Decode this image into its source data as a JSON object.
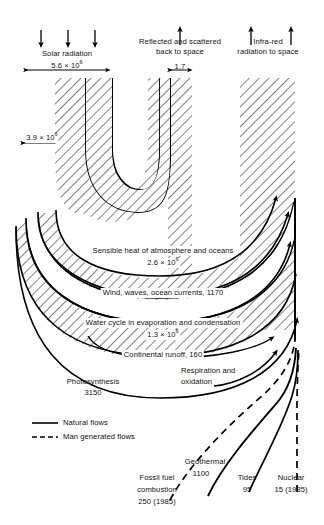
{
  "diagram": {
    "type": "energy-flow-sankey",
    "units_note": "values in 10^12 W (TW) unless noted"
  },
  "inputs": {
    "solar": {
      "label": "Solar radiation",
      "value_base": "5.6 × 10",
      "value_exp": "6",
      "value_text": "5.6 × 10⁶",
      "arrows": 3,
      "direction": "down"
    },
    "reflected": {
      "label_line1": "Reflected and scattered",
      "label_line2": "back to space",
      "value_text": "1.7",
      "arrows": 1,
      "direction": "up"
    },
    "infrared": {
      "label_line1": "Infra-red",
      "label_line2": "radiation to space",
      "arrows": 2,
      "direction": "up"
    }
  },
  "flows": {
    "direct_reflection": {
      "label_base": "3.9 × 10",
      "label_exp": "6",
      "label_text": "3.9 × 10⁶"
    },
    "sensible_heat": {
      "label": "Sensible heat of atmosphere and oceans",
      "value_base": "2.6 × 10",
      "value_exp": "6",
      "value_text": "2.6 × 10⁶"
    },
    "wind": {
      "label": "Wind, waves, ocean currents, 1170",
      "value_text": "1170"
    },
    "water_cycle": {
      "label": "Water cycle in evaporation and condensation",
      "value_base": "1.3 × 10",
      "value_exp": "6",
      "value_text": "1.3 × 10⁶"
    },
    "continental_runoff": {
      "label": "Continental runoff, 160",
      "value_text": "160"
    },
    "photosynthesis": {
      "label": "Photosynthesis",
      "value_text": "3150"
    },
    "respiration": {
      "label_line1": "Respiration and",
      "label_line2": "oxidation"
    }
  },
  "sources": {
    "fossil_fuel": {
      "label_line1": "Fossil fuel",
      "label_line2": "combustion",
      "label_line3": "250 (1985)",
      "style": "dashed"
    },
    "geothermal": {
      "label_line1": "Geothermal",
      "label_line2": "1100",
      "style": "solid"
    },
    "tides": {
      "label_line1": "Tides",
      "label_line2": "95",
      "style": "solid"
    },
    "nuclear": {
      "label_line1": "Nuclear",
      "label_line2": "15 (1985)",
      "style": "dashed"
    }
  },
  "legend": {
    "natural": "Natural flows",
    "man_generated": "Man generated flows"
  },
  "colors": {
    "ink": "#000000",
    "background": "#ffffff",
    "hatch": "#1a1a1a"
  }
}
